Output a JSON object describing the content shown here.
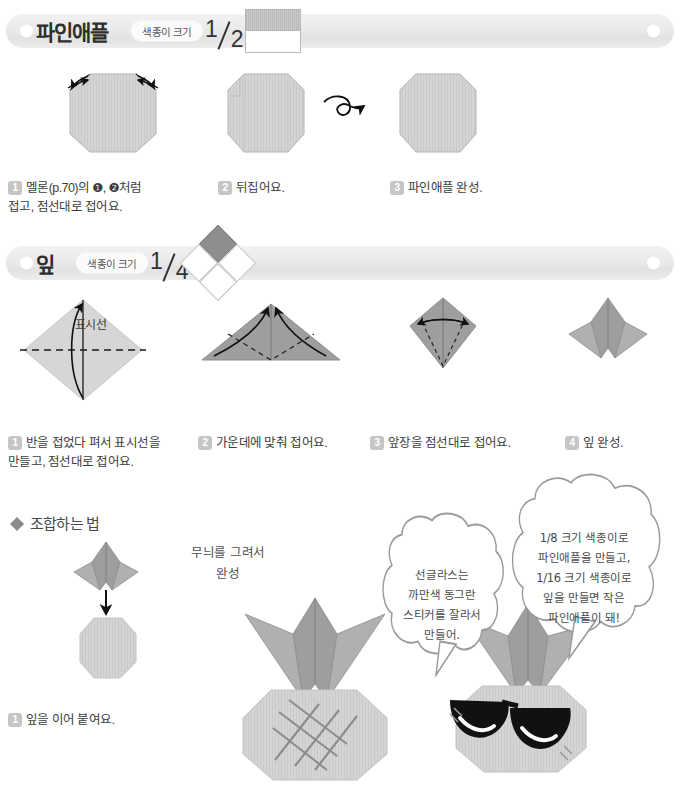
{
  "sections": [
    {
      "id": "pineapple",
      "title": "파인애플",
      "size_label": "색종이 크기",
      "fraction_num": "1",
      "fraction_den": "2",
      "size_icon": "half-square-icon",
      "steps": [
        {
          "n": "1",
          "text": "멜론(p.70)의 ❶, ❷처럼\n접고, 점선대로 접어요."
        },
        {
          "n": "2",
          "text": "뒤집어요."
        },
        {
          "n": "3",
          "text": "파인애플 완성."
        }
      ]
    },
    {
      "id": "leaf",
      "title": "잎",
      "size_label": "색종이 크기",
      "fraction_num": "1",
      "fraction_den": "4",
      "size_icon": "quarter-diamond-icon",
      "steps": [
        {
          "n": "1",
          "text": "반을 접었다 펴서 표시선을\n만들고, 점선대로 접어요."
        },
        {
          "n": "2",
          "text": "가운데에 맞춰 접어요."
        },
        {
          "n": "3",
          "text": "앞장을 점선대로 접어요."
        },
        {
          "n": "4",
          "text": "잎 완성."
        }
      ],
      "diagram_label": "표시선"
    }
  ],
  "assembly": {
    "heading": "조합하는 법",
    "step": {
      "n": "1",
      "text": "잎을 이어 붙여요."
    },
    "note": "무늬를 그려서\n완성",
    "bubbles": [
      {
        "id": "sunglasses-tip",
        "text": "선글라스는\n까만색 동그란\n스티커를 잘라서\n만들어."
      },
      {
        "id": "size-tip",
        "text": "1/8 크기 색종이로\n파인애플을 만들고,\n1/16 크기 색종이로\n잎을 만들면 작은\n파인애플이 돼!"
      }
    ]
  },
  "inline_badges": {
    "one": "❶",
    "two": "❷"
  },
  "colors": {
    "paper_light": "#cfcfcf",
    "paper_mid": "#9e9e9e",
    "paper_dark": "#8a8a8a",
    "header_bg": "#ebebeb",
    "badge_bg": "#c6c6c6",
    "ink": "#1a1a1a"
  }
}
